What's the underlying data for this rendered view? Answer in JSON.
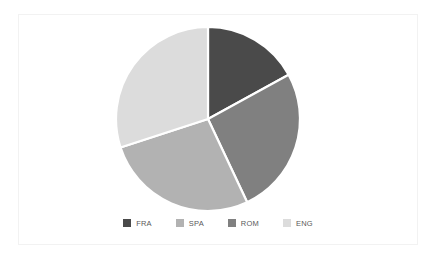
{
  "chart_data": {
    "type": "pie",
    "title": "",
    "subtitle": "",
    "xlabel": "",
    "ylabel": "",
    "grid": false,
    "legend_position": "bottom",
    "categories": [
      "FRA",
      "SPA",
      "ROM",
      "ENG"
    ],
    "values": [
      17,
      27,
      26,
      30
    ],
    "units": "percent",
    "start_angle_deg": 0,
    "direction": "clockwise",
    "slices": [
      {
        "label": "FRA",
        "value": 17,
        "color": "#4a4a4a",
        "start_angle_deg": 0,
        "end_angle_deg": 61.2
      },
      {
        "label": "ROM",
        "value": 26,
        "color": "#808080",
        "start_angle_deg": 61.2,
        "end_angle_deg": 154.8
      },
      {
        "label": "SPA",
        "value": 27,
        "color": "#b2b2b2",
        "start_angle_deg": 154.8,
        "end_angle_deg": 252.0
      },
      {
        "label": "ENG",
        "value": 30,
        "color": "#dcdcdc",
        "start_angle_deg": 252.0,
        "end_angle_deg": 360.0
      }
    ]
  },
  "legend": {
    "entries": [
      {
        "label": "FRA",
        "color": "#4a4a4a"
      },
      {
        "label": "SPA",
        "color": "#b2b2b2"
      },
      {
        "label": "ROM",
        "color": "#808080"
      },
      {
        "label": "ENG",
        "color": "#dcdcdc"
      }
    ]
  },
  "frame": {
    "border_color": "#f2f2f2",
    "background_color": "#ffffff"
  }
}
